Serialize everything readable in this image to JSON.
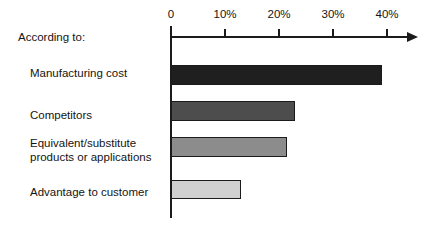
{
  "prompt": {
    "label": "According to:"
  },
  "chart_data": {
    "type": "bar",
    "orientation": "horizontal",
    "title": "",
    "subtitle": "",
    "xlabel": "",
    "ylabel": "",
    "xlim": [
      0,
      46
    ],
    "grid": false,
    "legend": "none",
    "categories": [
      "Manufacturing cost",
      "Competitors",
      "Equivalent/substitute\nproducts or applications",
      "Advantage to customer"
    ],
    "values": [
      39,
      23,
      21.5,
      13
    ],
    "value_labels": [
      "39%",
      "23%",
      "21.5%",
      "13%"
    ],
    "bar_colors": [
      "#1f1f1f",
      "#4d4d4d",
      "#8c8c8c",
      "#d0d0d0"
    ],
    "axis_color": "#1b1b1b",
    "tick_values": [
      0,
      10,
      20,
      30,
      40
    ],
    "tick_labels": [
      "0",
      "10%",
      "20%",
      "30%",
      "40%"
    ]
  },
  "axis": {
    "ticks": [
      {
        "label": "0",
        "value": 0
      },
      {
        "label": "10%",
        "value": 10
      },
      {
        "label": "20%",
        "value": 20
      },
      {
        "label": "30%",
        "value": 30
      },
      {
        "label": "40%",
        "value": 40
      }
    ]
  },
  "bars": [
    {
      "label": "Manufacturing cost",
      "label_line2": "",
      "value": 39,
      "color": "#1f1f1f"
    },
    {
      "label": "Competitors",
      "label_line2": "",
      "value": 23,
      "color": "#4d4d4d"
    },
    {
      "label": "Equivalent/substitute",
      "label_line2": "products or applications",
      "value": 21.5,
      "color": "#8c8c8c"
    },
    {
      "label": "Advantage to customer",
      "label_line2": "",
      "value": 13,
      "color": "#d0d0d0"
    }
  ],
  "geometry": {
    "origin_x": 170,
    "px_per_percent": 5.4,
    "axis_y": 36,
    "axis_bottom": 218,
    "arrow_tip_x": 418,
    "label_x": 30,
    "rows": [
      {
        "bar_top": 65,
        "bar_height": 20,
        "label_top": 66
      },
      {
        "bar_top": 101,
        "bar_height": 20,
        "label_top": 108
      },
      {
        "bar_top": 137,
        "bar_height": 20,
        "label_top": 136
      },
      {
        "bar_top": 180,
        "bar_height": 19,
        "label_top": 185
      }
    ]
  }
}
